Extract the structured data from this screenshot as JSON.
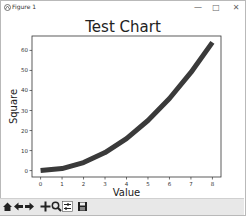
{
  "window": {
    "title": "Figure 1",
    "controls": [
      "minimize",
      "maximize",
      "close"
    ],
    "minimize_glyph": "—",
    "maximize_glyph": "□",
    "close_glyph": "✕"
  },
  "toolbar": {
    "buttons": [
      "home-icon",
      "back-icon",
      "forward-icon",
      "pan-icon",
      "zoom-icon",
      "configure-subplots-icon",
      "save-icon"
    ]
  },
  "chart_data": {
    "type": "line",
    "title": "Test Chart",
    "xlabel": "Value",
    "ylabel": "Square",
    "x": [
      0,
      1,
      2,
      3,
      4,
      5,
      6,
      7,
      8
    ],
    "series": [
      {
        "name": "Square",
        "values": [
          0,
          1,
          4,
          9,
          16,
          25,
          36,
          49,
          64
        ],
        "color": "#3a3a3a",
        "linewidth": 5
      }
    ],
    "xticks": [
      "0",
      "1",
      "2",
      "3",
      "4",
      "5",
      "6",
      "7",
      "8"
    ],
    "yticks": [
      "0",
      "10",
      "20",
      "30",
      "40",
      "50",
      "60"
    ],
    "xlim": [
      -0.4,
      8.4
    ],
    "ylim": [
      -3.2,
      67.2
    ],
    "grid": false,
    "legend": false
  }
}
